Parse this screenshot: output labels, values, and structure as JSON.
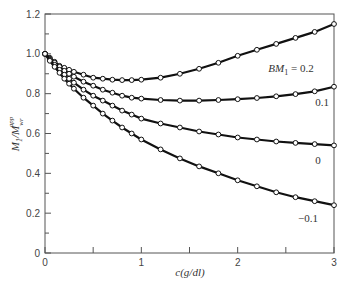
{
  "chart_data": {
    "type": "line",
    "title": "",
    "xlabel": "c(g/dl)",
    "ylabel": "M1/M_wr^app",
    "xlim": [
      0,
      3
    ],
    "ylim": [
      0,
      1.2
    ],
    "grid": false,
    "legend_position": "inline labels at right end of curves",
    "x_ticks": [
      "0",
      "1",
      "2",
      "3"
    ],
    "y_ticks": [
      "0",
      "0.2",
      "0.4",
      "0.6",
      "0.8",
      "1.0",
      "1.2"
    ],
    "x": [
      0,
      0.05,
      0.1,
      0.15,
      0.2,
      0.25,
      0.3,
      0.4,
      0.5,
      0.6,
      0.7,
      0.8,
      0.9,
      1.0,
      1.2,
      1.4,
      1.6,
      1.8,
      2.0,
      2.2,
      2.4,
      2.6,
      2.8,
      3.0
    ],
    "series": [
      {
        "name": "BM1 = 0.2",
        "label": "BM₁ = 0.2",
        "values": [
          1.0,
          0.98,
          0.96,
          0.94,
          0.93,
          0.92,
          0.91,
          0.895,
          0.88,
          0.875,
          0.87,
          0.868,
          0.868,
          0.87,
          0.88,
          0.9,
          0.925,
          0.955,
          0.99,
          1.02,
          1.05,
          1.08,
          1.11,
          1.15
        ]
      },
      {
        "name": "0.1",
        "label": "0.1",
        "values": [
          1.0,
          0.975,
          0.955,
          0.935,
          0.915,
          0.9,
          0.885,
          0.86,
          0.84,
          0.82,
          0.805,
          0.79,
          0.78,
          0.775,
          0.768,
          0.765,
          0.765,
          0.768,
          0.772,
          0.778,
          0.787,
          0.798,
          0.812,
          0.835
        ]
      },
      {
        "name": "0",
        "label": "0",
        "values": [
          1.0,
          0.97,
          0.945,
          0.92,
          0.895,
          0.875,
          0.855,
          0.82,
          0.79,
          0.765,
          0.74,
          0.715,
          0.695,
          0.675,
          0.65,
          0.63,
          0.61,
          0.595,
          0.58,
          0.57,
          0.56,
          0.553,
          0.547,
          0.54
        ]
      },
      {
        "name": "-0.1",
        "label": "−0.1",
        "values": [
          1.0,
          0.965,
          0.935,
          0.905,
          0.875,
          0.85,
          0.825,
          0.78,
          0.74,
          0.7,
          0.665,
          0.63,
          0.6,
          0.57,
          0.52,
          0.475,
          0.435,
          0.4,
          0.365,
          0.335,
          0.305,
          0.28,
          0.26,
          0.24
        ]
      }
    ],
    "annotations": [
      "BM₁ = 0.2",
      "0.1",
      "0",
      "−0.1"
    ],
    "marker": "open-circle",
    "line_color": "#111111"
  }
}
